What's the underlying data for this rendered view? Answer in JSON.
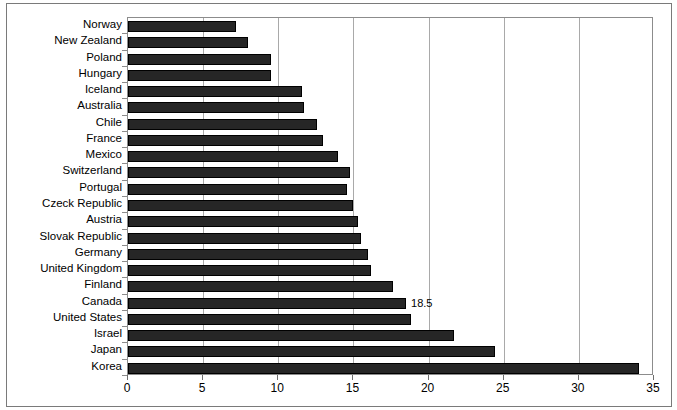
{
  "chart_data": {
    "type": "bar",
    "orientation": "horizontal",
    "title": "",
    "xlabel": "",
    "ylabel": "",
    "xlim": [
      0,
      35
    ],
    "xticks": [
      0,
      5,
      10,
      15,
      20,
      25,
      30,
      35
    ],
    "grid": true,
    "legend": false,
    "bar_color": "#262626",
    "categories": [
      "Norway",
      "New Zealand",
      "Poland",
      "Hungary",
      "Iceland",
      "Australia",
      "Chile",
      "France",
      "Mexico",
      "Switzerland",
      "Portugal",
      "Czeck Republic",
      "Austria",
      "Slovak Republic",
      "Germany",
      "United Kingdom",
      "Finland",
      "Canada",
      "United States",
      "Israel",
      "Japan",
      "Korea"
    ],
    "values": [
      7.2,
      8.0,
      9.5,
      9.5,
      11.6,
      11.7,
      12.6,
      13.0,
      14.0,
      14.8,
      14.6,
      15.0,
      15.3,
      15.5,
      16.0,
      16.2,
      17.6,
      18.5,
      18.8,
      21.7,
      24.4,
      34.0
    ],
    "data_labels": [
      "",
      "",
      "",
      "",
      "",
      "",
      "",
      "",
      "",
      "",
      "",
      "",
      "",
      "",
      "",
      "",
      "",
      "18.5",
      "",
      "",
      "",
      ""
    ]
  }
}
